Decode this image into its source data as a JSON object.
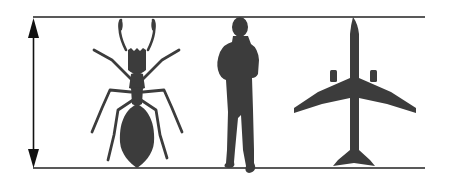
{
  "diagram": {
    "type": "scale-comparison",
    "colors": {
      "background": "#ffffff",
      "silhouette": "#3c3c3c",
      "line": "#222222"
    },
    "reference_lines": [
      "top-line",
      "bottom-line"
    ],
    "height_indicator": "double-headed-arrow",
    "figures": [
      {
        "id": "ant",
        "name": "ant-silhouette"
      },
      {
        "id": "human",
        "name": "human-silhouette"
      },
      {
        "id": "airplane",
        "name": "airplane-silhouette"
      }
    ]
  }
}
